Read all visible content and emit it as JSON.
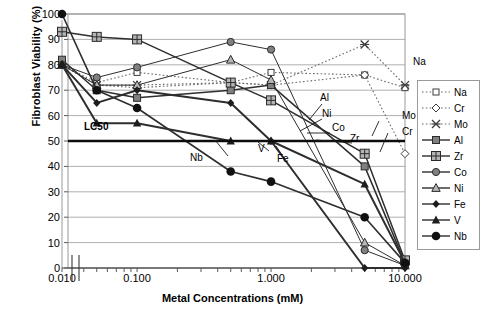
{
  "chart_data": {
    "type": "line",
    "title": "",
    "xlabel": "Metal Concentrations (mM)",
    "ylabel": "Fibroblast Viability (%)",
    "xscale": "log",
    "xlim": [
      0.01,
      10.0
    ],
    "ylim": [
      0,
      100
    ],
    "ytick_labels": [
      "100",
      "90",
      "80",
      "70",
      "60",
      "50",
      "40",
      "30",
      "20",
      "10",
      "0"
    ],
    "ytick_values": [
      100,
      90,
      80,
      70,
      60,
      50,
      40,
      30,
      20,
      10,
      0
    ],
    "xtick_labels": [
      "0.010",
      "0.100",
      "1.000",
      "10.000"
    ],
    "xtick_values": [
      0.01,
      0.1,
      1.0,
      10.0
    ],
    "axis_break": true,
    "grid": "horizontal",
    "threshold": {
      "label": "LC50",
      "value": 50
    },
    "legend_position": "right",
    "series": [
      {
        "name": "Na",
        "style": "dotted",
        "marker": "open-square",
        "x": [
          0.01,
          0.05,
          0.1,
          0.5,
          1.0,
          5.0,
          10.0
        ],
        "values": [
          80,
          73,
          77,
          73,
          77,
          76,
          71
        ]
      },
      {
        "name": "Cr",
        "style": "dotted",
        "marker": "open-diamond",
        "x": [
          0.01,
          0.05,
          0.1,
          0.5,
          1.0,
          5.0,
          10.0
        ],
        "values": [
          80,
          72,
          71,
          73,
          72,
          76,
          45
        ]
      },
      {
        "name": "Mo",
        "style": "dotted",
        "marker": "cross",
        "x": [
          0.01,
          0.05,
          0.1,
          0.5,
          1.0,
          5.0,
          10.0
        ],
        "values": [
          80,
          72,
          72,
          73,
          72,
          88,
          72
        ]
      },
      {
        "name": "Al",
        "style": "solid",
        "marker": "square",
        "x": [
          0.01,
          0.05,
          0.1,
          0.5,
          1.0,
          5.0,
          10.0
        ],
        "values": [
          82,
          70,
          67,
          70,
          72,
          40,
          2
        ]
      },
      {
        "name": "Zr",
        "style": "solid",
        "marker": "grid-square",
        "x": [
          0.01,
          0.05,
          0.1,
          0.5,
          1.0,
          5.0,
          10.0
        ],
        "values": [
          93,
          91,
          90,
          73,
          66,
          45,
          3
        ]
      },
      {
        "name": "Co",
        "style": "solid",
        "marker": "dot-circle",
        "x": [
          0.01,
          0.05,
          0.1,
          0.5,
          1.0,
          5.0,
          10.0
        ],
        "values": [
          80,
          75,
          79,
          89,
          86,
          7,
          1
        ]
      },
      {
        "name": "Ni",
        "style": "solid",
        "marker": "triangle-open",
        "x": [
          0.01,
          0.05,
          0.1,
          0.5,
          1.0,
          5.0,
          10.0
        ],
        "values": [
          80,
          72,
          72,
          82,
          74,
          10,
          1
        ]
      },
      {
        "name": "Fe",
        "style": "solid",
        "marker": "diamond",
        "x": [
          0.01,
          0.05,
          0.1,
          0.5,
          1.0,
          5.0,
          10.0
        ],
        "values": [
          80,
          65,
          70,
          65,
          50,
          0,
          0
        ]
      },
      {
        "name": "V",
        "style": "solid",
        "marker": "triangle",
        "x": [
          0.01,
          0.05,
          0.1,
          0.5,
          1.0,
          5.0,
          10.0
        ],
        "values": [
          80,
          57,
          57,
          50,
          50,
          33,
          2
        ]
      },
      {
        "name": "Nb",
        "style": "solid",
        "marker": "circle",
        "x": [
          0.01,
          0.05,
          0.1,
          0.5,
          1.0,
          5.0,
          10.0
        ],
        "values": [
          100,
          70,
          63,
          38,
          34,
          20,
          2
        ]
      }
    ],
    "inline_annotations": [
      {
        "label": "Na"
      },
      {
        "label": "Mo"
      },
      {
        "label": "Cr"
      },
      {
        "label": "Al"
      },
      {
        "label": "Ni"
      },
      {
        "label": "Co"
      },
      {
        "label": "Zr"
      },
      {
        "label": "V"
      },
      {
        "label": "Fe"
      },
      {
        "label": "Nb"
      }
    ]
  },
  "legend": {
    "items": [
      {
        "label": "Na"
      },
      {
        "label": "Cr"
      },
      {
        "label": "Mo"
      },
      {
        "label": "Al"
      },
      {
        "label": "Zr"
      },
      {
        "label": "Co"
      },
      {
        "label": "Ni"
      },
      {
        "label": "Fe"
      },
      {
        "label": "V"
      },
      {
        "label": "Nb"
      }
    ]
  }
}
